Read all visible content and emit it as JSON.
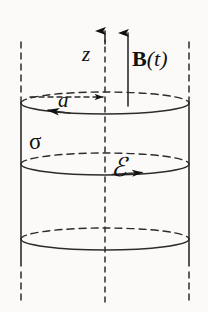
{
  "figure": {
    "type": "physics-diagram",
    "background_color": "#fbfaf8",
    "ink_color": "#111111",
    "labels": {
      "axis_z": "z",
      "field_vector_bold": "B",
      "field_vector_arg": "(t)",
      "radius": "a",
      "conductivity": "σ",
      "emf": "ℰ"
    },
    "geometry": {
      "center_x": 105,
      "radius_x": 84,
      "radius_y": 11,
      "top_ellipse_cy": 103,
      "middle_ellipse_cy": 164,
      "bottom_ellipse_cy": 239,
      "left_wall_x": 21,
      "right_wall_x": 189,
      "axis_top_y": 28,
      "axis_bottom_y": 302,
      "b_arrow_x": 128,
      "b_arrow_tip_y": 30,
      "b_arrow_tail_y": 106
    },
    "elements": {
      "axis_arrow": "z-axis dashed center line with upward arrowhead",
      "field_arrow": "solid upward arrow labeled B(t)",
      "radius_arrow": "dashed horizontal segment from cylinder wall to axis, arrowhead pointing right, labeled a",
      "top_circle": "ellipse, back half dashed, front half solid, counterclockwise arrowhead at left",
      "middle_circle": "ellipse, back half dashed, front half solid, arrowhead pointing right at front",
      "bottom_circle": "ellipse, back half dashed, front half solid",
      "side_walls": "two vertical solid lines with dashed extensions above and below"
    }
  }
}
